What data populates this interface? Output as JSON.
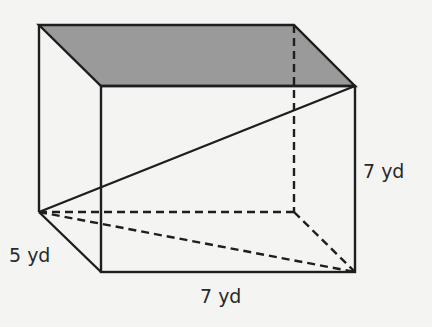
{
  "diagram": {
    "type": "rectangular-prism",
    "colors": {
      "background": "#f4f4f2",
      "stroke": "#1e1e1e",
      "top_face_fill": "#9a9a9a"
    },
    "vertices": {
      "back_top_left": [
        39,
        25
      ],
      "back_top_right": [
        294,
        25
      ],
      "front_top_left": [
        101,
        86
      ],
      "front_top_right": [
        355,
        86
      ],
      "back_bottom_left": [
        39,
        212
      ],
      "back_bottom_right": [
        294,
        212
      ],
      "front_bottom_left": [
        101,
        272
      ],
      "front_bottom_right": [
        355,
        272
      ]
    },
    "labels": {
      "depth": "5 yd",
      "length": "7 yd",
      "height": "7 yd"
    }
  }
}
